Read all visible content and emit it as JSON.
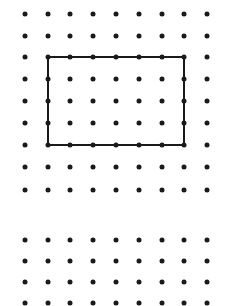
{
  "figure": {
    "type": "dot-grid",
    "dot_color": "#1a1a1a",
    "background": "#ffffff",
    "columns_x": [
      25,
      48,
      70,
      93,
      116,
      139,
      162,
      184,
      207
    ],
    "grids": [
      {
        "name": "top-grid",
        "rows_y": [
          14,
          36,
          57,
          79,
          101,
          123,
          145,
          167,
          190
        ]
      },
      {
        "name": "bottom-grid",
        "rows_y": [
          240,
          261,
          282,
          303
        ]
      }
    ],
    "rectangle": {
      "label": "rectangle",
      "grid": "top-grid",
      "from_col": 1,
      "to_col": 7,
      "from_row": 2,
      "to_row": 6,
      "width_units": 6,
      "height_units": 4,
      "stroke_color": "#1a1a1a"
    }
  }
}
